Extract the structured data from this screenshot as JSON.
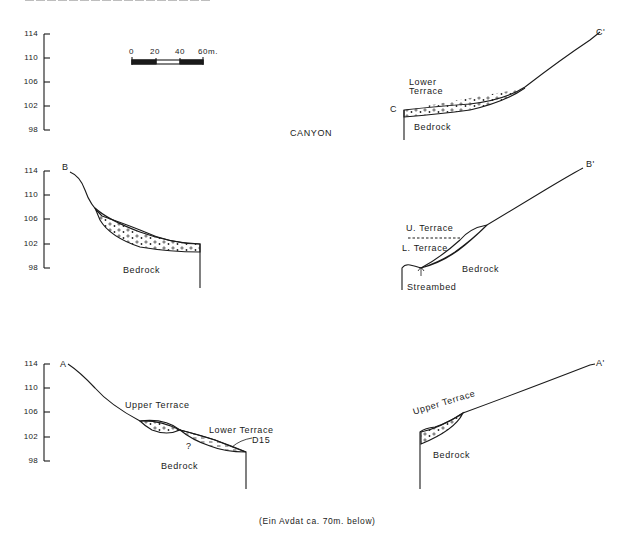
{
  "figure": {
    "header_cut_text": "",
    "canyon_label": "CANYON",
    "footer_note": "(Ein Avdat ca. 70m. below)",
    "scale_bar": {
      "ticks": [
        "0",
        "20",
        "40",
        "60m."
      ]
    }
  },
  "axes": {
    "ticks": [
      "114",
      "110",
      "106",
      "102",
      "98"
    ]
  },
  "sections": {
    "C": {
      "start_label": "C",
      "end_label": "C'",
      "labels": {
        "terrace_line1": "Lower",
        "terrace_line2": "Terrace",
        "bedrock": "Bedrock"
      }
    },
    "B": {
      "start_label": "B",
      "end_label": "B'",
      "labels": {
        "bedrock_left": "Bedrock",
        "u_terrace": "U. Terrace",
        "l_terrace": "L. Terrace",
        "bedrock_right": "Bedrock",
        "streambed": "Streambed"
      }
    },
    "A": {
      "start_label": "A",
      "end_label": "A'",
      "labels": {
        "upper_terrace_left": "Upper Terrace",
        "lower_terrace": "Lower Terrace",
        "d15": "D15",
        "question": "?",
        "bedrock_left": "Bedrock",
        "upper_terrace_right": "Upper Terrace",
        "bedrock_right": "Bedrock"
      }
    }
  }
}
